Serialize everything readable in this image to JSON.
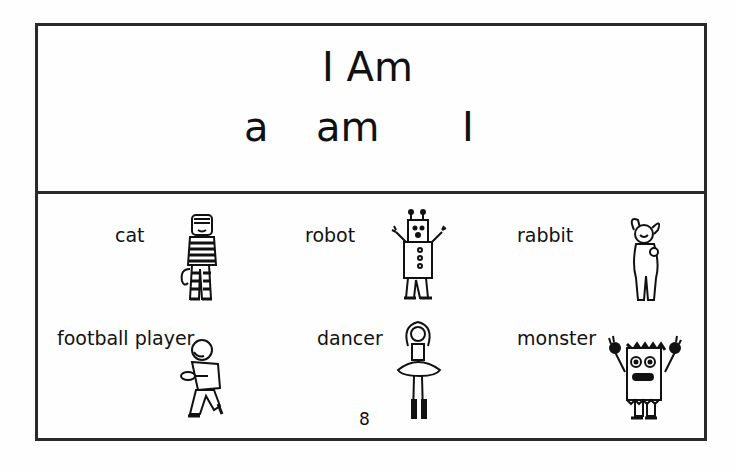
{
  "title": "I Am",
  "sight_words": [
    "a",
    "am",
    "I"
  ],
  "items": [
    {
      "label": "cat",
      "icon": "cat-costume-icon"
    },
    {
      "label": "robot",
      "icon": "robot-costume-icon"
    },
    {
      "label": "rabbit",
      "icon": "rabbit-costume-icon"
    },
    {
      "label": "football player",
      "icon": "football-player-icon"
    },
    {
      "label": "dancer",
      "icon": "dancer-icon"
    },
    {
      "label": "monster",
      "icon": "monster-costume-icon"
    }
  ],
  "page_number": "8",
  "colors": {
    "ink": "#111111",
    "border": "#2a2a2a",
    "paper": "#fefefe"
  }
}
